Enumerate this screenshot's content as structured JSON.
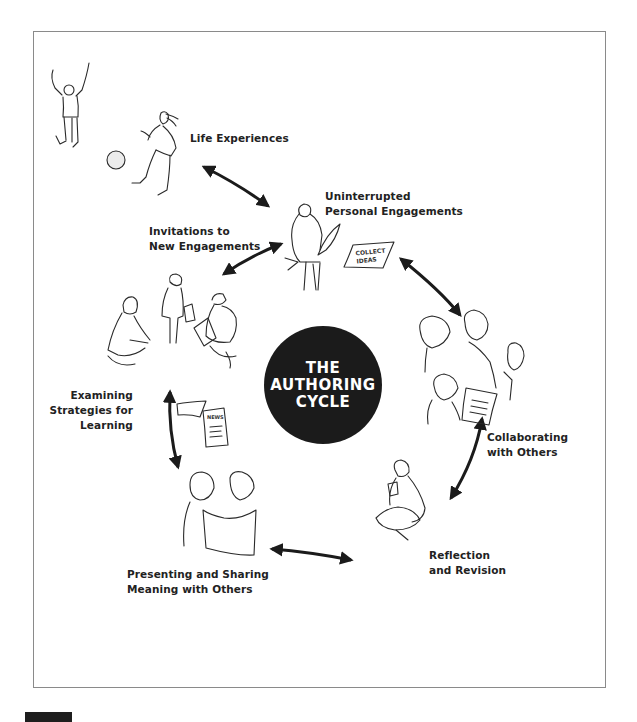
{
  "diagram": {
    "title_lines": [
      "THE",
      "AUTHORING",
      "CYCLE"
    ],
    "stages": {
      "life_experiences": [
        "Life Experiences"
      ],
      "uninterrupted": [
        "Uninterrupted",
        "Personal Engagements"
      ],
      "invitations": [
        "Invitations to",
        "New Engagements"
      ],
      "examining": [
        "Examining",
        "Strategies for",
        "Learning"
      ],
      "collaborating": [
        "Collaborating",
        "with Others"
      ],
      "reflection": [
        "Reflection",
        "and Revision"
      ],
      "presenting": [
        "Presenting and Sharing",
        "Meaning with Others"
      ]
    },
    "sketch_notes": {
      "collect_ideas": [
        "COLLECT",
        "IDEAS"
      ],
      "news": "NEWS"
    },
    "arrows": [
      {
        "from": "Life Experiences",
        "to": "Uninterrupted Personal Engagements",
        "type": "double"
      },
      {
        "from": "Invitations to New Engagements",
        "to": "Uninterrupted Personal Engagements",
        "type": "double"
      },
      {
        "from": "Uninterrupted Personal Engagements",
        "to": "Collaborating with Others",
        "type": "double"
      },
      {
        "from": "Collaborating with Others",
        "to": "Reflection and Revision",
        "type": "double"
      },
      {
        "from": "Reflection and Revision",
        "to": "Presenting and Sharing Meaning with Others",
        "type": "double"
      },
      {
        "from": "Presenting and Sharing Meaning with Others",
        "to": "Examining Strategies for Learning",
        "type": "double"
      }
    ],
    "colors": {
      "ink": "#1b1b1b",
      "frame": "#8a8a8a",
      "background": "#ffffff"
    }
  }
}
